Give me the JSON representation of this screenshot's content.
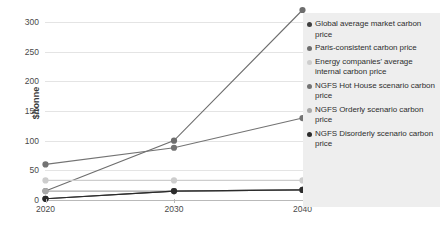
{
  "chart_data": {
    "type": "line",
    "title": "",
    "xlabel": "",
    "ylabel": "$/tonne",
    "x": [
      2020,
      2030,
      2040
    ],
    "xtick_labels": [
      "2020",
      "2030",
      "2040"
    ],
    "ytick_labels": [
      "0",
      "50",
      "100",
      "150",
      "200",
      "250",
      "300"
    ],
    "ytick_values": [
      0,
      50,
      100,
      150,
      200,
      250,
      300
    ],
    "ylim": [
      0,
      320
    ],
    "grid": true,
    "legend_position": "right",
    "series": [
      {
        "name": "Global average market carbon price",
        "color": "#3f3f3f",
        "values": [
          2,
          15,
          17
        ]
      },
      {
        "name": "Paris-consistent carbon price",
        "color": "#6e6e6e",
        "values": [
          15,
          100,
          320
        ]
      },
      {
        "name": "Energy companies' average internal carbon price",
        "color": "#cdcdcd",
        "values": [
          33,
          33,
          33
        ]
      },
      {
        "name": "NGFS Hot House scenario carbon price",
        "color": "#737373",
        "values": [
          60,
          88,
          138
        ]
      },
      {
        "name": "NGFS Orderly scenario carbon price",
        "color": "#a8a8a8",
        "values": [
          15,
          15,
          17
        ]
      },
      {
        "name": "NGFS Disorderly scenario carbon price",
        "color": "#2b2b2b",
        "values": [
          2,
          15,
          17
        ]
      }
    ]
  },
  "legend": {
    "items": [
      {
        "label": "Global average market carbon price",
        "color": "#3f3f3f"
      },
      {
        "label": "Paris-consistent carbon price",
        "color": "#6e6e6e"
      },
      {
        "label": "Energy companies' average internal carbon price",
        "color": "#cdcdcd"
      },
      {
        "label": "NGFS Hot House scenario carbon price",
        "color": "#737373"
      },
      {
        "label": "NGFS Orderly scenario carbon price",
        "color": "#a8a8a8"
      },
      {
        "label": "NGFS Disorderly scenario carbon price",
        "color": "#2b2b2b"
      }
    ]
  }
}
